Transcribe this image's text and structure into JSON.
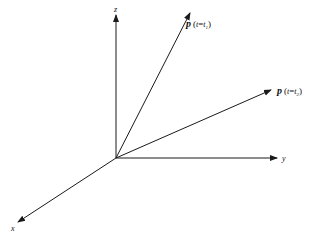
{
  "diagram": {
    "type": "3d-coordinate-vectors",
    "origin": {
      "x": 116,
      "y": 158
    },
    "axes": [
      {
        "id": "z",
        "label": "z",
        "end": {
          "x": 116,
          "y": 14
        }
      },
      {
        "id": "y",
        "label": "y",
        "end": {
          "x": 277,
          "y": 158
        }
      },
      {
        "id": "x",
        "label": "x",
        "end": {
          "x": 18,
          "y": 222
        }
      }
    ],
    "vectors": [
      {
        "id": "p1",
        "symbol": "p",
        "paren_open": "(",
        "var": "t",
        "eq": "=",
        "sub_var": "t",
        "sub_index": "1",
        "paren_close": ")",
        "end": {
          "x": 190,
          "y": 13
        }
      },
      {
        "id": "p2",
        "symbol": "p",
        "paren_open": "(",
        "var": "t",
        "eq": "=",
        "sub_var": "t",
        "sub_index": "2",
        "paren_close": ")",
        "end": {
          "x": 271,
          "y": 90
        }
      }
    ],
    "line_color": "#1a1a1a",
    "background": "#ffffff"
  }
}
